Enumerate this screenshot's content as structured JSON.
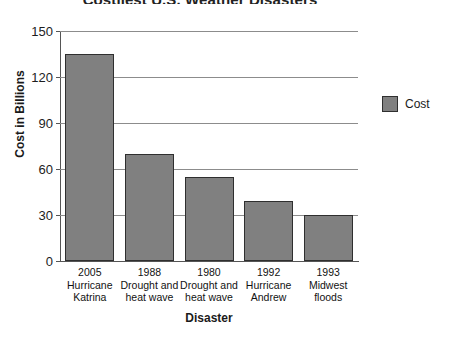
{
  "chart_data": {
    "type": "bar",
    "title": "Costliest U.S. Weather Disasters",
    "xlabel": "Disaster",
    "ylabel": "Cost in Billions",
    "ylim": [
      0,
      150
    ],
    "ytick_labels": [
      "0",
      "30",
      "60",
      "90",
      "120",
      "150"
    ],
    "ytick_values": [
      0,
      30,
      60,
      90,
      120,
      150
    ],
    "grid": "horizontal",
    "legend_position": "right",
    "bar_color": "#808080",
    "bar_outline_color": "#2f2f2f",
    "categories": [
      {
        "year": "2005",
        "line2": "Hurricane",
        "line3": "Katrina"
      },
      {
        "year": "1988",
        "line2": "Drought and",
        "line3": "heat wave"
      },
      {
        "year": "1980",
        "line2": "Drought and",
        "line3": "heat wave"
      },
      {
        "year": "1992",
        "line2": "Hurricane",
        "line3": "Andrew"
      },
      {
        "year": "1993",
        "line2": "Midwest",
        "line3": "floods"
      }
    ],
    "series": [
      {
        "name": "Cost",
        "values": [
          135,
          70,
          55,
          39,
          30
        ]
      }
    ]
  },
  "legend": {
    "entries": [
      {
        "label": "Cost",
        "color": "#808080"
      }
    ]
  }
}
